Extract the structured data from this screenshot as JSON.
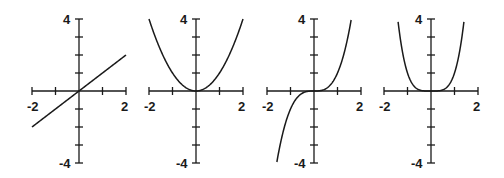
{
  "chart_data": [
    {
      "type": "line",
      "title": "",
      "function": "y = x",
      "xlim": [
        -2,
        2
      ],
      "ylim": [
        -4,
        4
      ],
      "x_tick_labels": [
        "-2",
        "2"
      ],
      "y_tick_labels": [
        "4",
        "-4"
      ],
      "x_ticks": [
        -2,
        -1,
        0,
        1,
        2
      ],
      "y_ticks": [
        -4,
        -3,
        -2,
        -1,
        0,
        1,
        2,
        3,
        4
      ],
      "x": [
        -2,
        -1,
        0,
        1,
        2
      ],
      "values": [
        -2,
        -1,
        0,
        1,
        2
      ],
      "grid": false
    },
    {
      "type": "line",
      "title": "",
      "function": "y = x^2",
      "xlim": [
        -2,
        2
      ],
      "ylim": [
        -4,
        4
      ],
      "x_tick_labels": [
        "-2",
        "2"
      ],
      "y_tick_labels": [
        "4",
        "-4"
      ],
      "x_ticks": [
        -2,
        -1,
        0,
        1,
        2
      ],
      "y_ticks": [
        -4,
        -3,
        -2,
        -1,
        0,
        1,
        2,
        3,
        4
      ],
      "x": [
        -2,
        -1.5,
        -1,
        -0.5,
        0,
        0.5,
        1,
        1.5,
        2
      ],
      "values": [
        4,
        2.25,
        1,
        0.25,
        0,
        0.25,
        1,
        2.25,
        4
      ],
      "grid": false
    },
    {
      "type": "line",
      "title": "",
      "function": "y = x^3",
      "xlim": [
        -2,
        2
      ],
      "ylim": [
        -4,
        4
      ],
      "x_tick_labels": [
        "-2",
        "2"
      ],
      "y_tick_labels": [
        "4",
        "-4"
      ],
      "x_ticks": [
        -2,
        -1,
        0,
        1,
        2
      ],
      "y_ticks": [
        -4,
        -3,
        -2,
        -1,
        0,
        1,
        2,
        3,
        4
      ],
      "x": [
        -1.587,
        -1,
        -0.5,
        0,
        0.5,
        1,
        1.587
      ],
      "values": [
        -4,
        -1,
        -0.125,
        0,
        0.125,
        1,
        4
      ],
      "grid": false
    },
    {
      "type": "line",
      "title": "",
      "function": "y = x^4",
      "xlim": [
        -2,
        2
      ],
      "ylim": [
        -4,
        4
      ],
      "x_tick_labels": [
        "-2",
        "2"
      ],
      "y_tick_labels": [
        "4",
        "-4"
      ],
      "x_ticks": [
        -2,
        -1,
        0,
        1,
        2
      ],
      "y_ticks": [
        -4,
        -3,
        -2,
        -1,
        0,
        1,
        2,
        3,
        4
      ],
      "x": [
        -1.414,
        -1,
        -0.5,
        0,
        0.5,
        1,
        1.414
      ],
      "values": [
        4,
        1,
        0.0625,
        0,
        0.0625,
        1,
        4
      ],
      "grid": false
    }
  ],
  "graphs": [
    {
      "id": "linear",
      "label_top": "4",
      "label_bottom": "-4",
      "label_left": "-2",
      "label_right": "2",
      "ox": 79,
      "exp": 1
    },
    {
      "id": "quadratic",
      "label_top": "4",
      "label_bottom": "-4",
      "label_left": "-2",
      "label_right": "2",
      "ox": 196,
      "exp": 2
    },
    {
      "id": "cubic",
      "label_top": "4",
      "label_bottom": "-4",
      "label_left": "-2",
      "label_right": "2",
      "ox": 314,
      "exp": 3
    },
    {
      "id": "quartic",
      "label_top": "4",
      "label_bottom": "-4",
      "label_left": "-2",
      "label_right": "2",
      "ox": 431,
      "exp": 4
    }
  ],
  "colors": {
    "ink": "#1a1a1a",
    "background": "#ffffff"
  }
}
